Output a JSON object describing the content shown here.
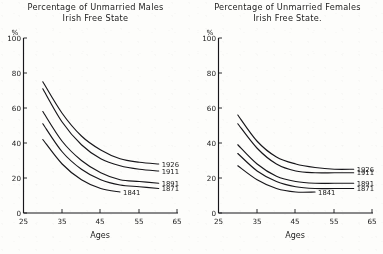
{
  "figure": {
    "background_color": "#fdfdfb",
    "ink_color": "#17161a"
  },
  "panels": [
    {
      "id": "males",
      "title_line1": "Percentage of Unmarried Males",
      "title_line2": "Irish Free State",
      "y_axis_unit": "%",
      "x_axis_title": "Ages",
      "y_ticks": [
        "100",
        "80",
        "60",
        "40",
        "20",
        "0"
      ],
      "x_ticks": [
        "25",
        "35",
        "45",
        "55",
        "65"
      ],
      "series_labels": [
        "1926",
        "1911",
        "1891",
        "1871",
        "1841"
      ]
    },
    {
      "id": "females",
      "title_line1": "Percentage of Unmarried Females",
      "title_line2": "Irish Free State.",
      "y_axis_unit": "%",
      "x_axis_title": "Ages",
      "y_ticks": [
        "100",
        "80",
        "60",
        "40",
        "20",
        "0"
      ],
      "x_ticks": [
        "25",
        "35",
        "45",
        "55",
        "65"
      ],
      "series_labels": [
        "1926",
        "1911",
        "1891",
        "1871",
        "1841"
      ]
    }
  ],
  "chart_data": [
    {
      "type": "line",
      "panel": "males",
      "title": "Percentage of Unmarried Males — Irish Free State",
      "xlabel": "Ages",
      "ylabel": "%",
      "xlim": [
        25,
        65
      ],
      "ylim": [
        0,
        100
      ],
      "grid": false,
      "legend_position": "inline-right-of-curve-ends",
      "x": [
        30,
        35,
        40,
        45,
        50,
        55,
        60
      ],
      "series": [
        {
          "name": "1926",
          "values": [
            75,
            57,
            44,
            36,
            31,
            29,
            28
          ]
        },
        {
          "name": "1911",
          "values": [
            71,
            52,
            39,
            31,
            27,
            25,
            24
          ]
        },
        {
          "name": "1891",
          "values": [
            58,
            41,
            30,
            23,
            19,
            18,
            17
          ]
        },
        {
          "name": "1871",
          "values": [
            51,
            35,
            25,
            19,
            16,
            15,
            14
          ]
        },
        {
          "name": "1841",
          "values": [
            42,
            28,
            19,
            14,
            12,
            null,
            null
          ]
        }
      ]
    },
    {
      "type": "line",
      "panel": "females",
      "title": "Percentage of Unmarried Females — Irish Free State.",
      "xlabel": "Ages",
      "ylabel": "%",
      "xlim": [
        25,
        65
      ],
      "ylim": [
        0,
        100
      ],
      "grid": false,
      "legend_position": "inline-right-of-curve-ends",
      "x": [
        30,
        35,
        40,
        45,
        50,
        55,
        60
      ],
      "series": [
        {
          "name": "1926",
          "values": [
            56,
            41,
            32,
            28,
            26,
            25,
            25
          ]
        },
        {
          "name": "1911",
          "values": [
            51,
            37,
            28,
            24,
            23,
            23,
            23
          ]
        },
        {
          "name": "1891",
          "values": [
            39,
            28,
            21,
            18,
            17,
            17,
            17
          ]
        },
        {
          "name": "1871",
          "values": [
            34,
            24,
            18,
            15,
            14,
            14,
            14
          ]
        },
        {
          "name": "1841",
          "values": [
            27,
            19,
            14,
            12,
            12,
            null,
            null
          ]
        }
      ]
    }
  ]
}
